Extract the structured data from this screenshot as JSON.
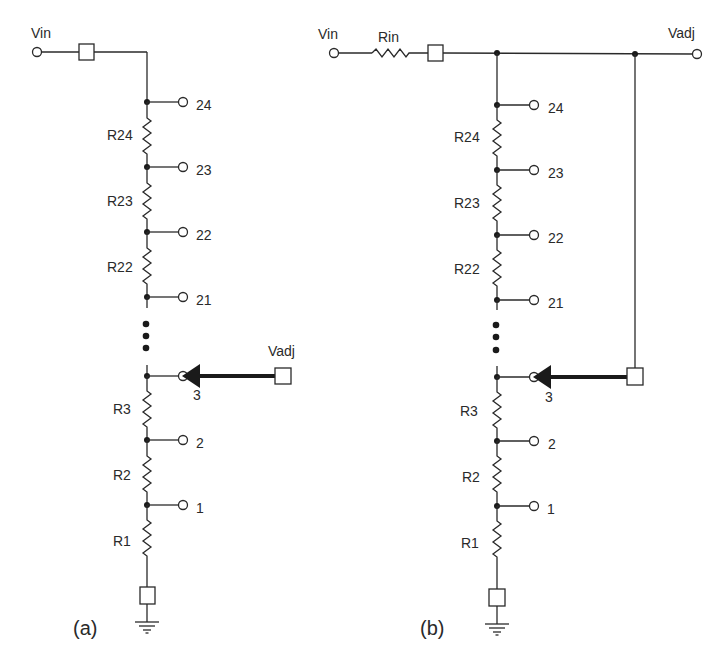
{
  "figure": {
    "panels": [
      {
        "id": "a",
        "caption": "(a)",
        "input_label": "Vin",
        "output_label": "Vadj",
        "resistors": [
          "R24",
          "R23",
          "R22",
          "R3",
          "R2",
          "R1"
        ],
        "taps": [
          "24",
          "23",
          "22",
          "21",
          "3",
          "2",
          "1"
        ],
        "selected_tap": "3"
      },
      {
        "id": "b",
        "caption": "(b)",
        "input_label": "Vin",
        "series_resistor": "Rin",
        "output_label": "Vadj",
        "resistors": [
          "R24",
          "R23",
          "R22",
          "R3",
          "R2",
          "R1"
        ],
        "taps": [
          "24",
          "23",
          "22",
          "21",
          "3",
          "2",
          "1"
        ],
        "selected_tap": "3"
      }
    ],
    "colors": {
      "line": "#2a2a2a",
      "node": "#1a1a1a",
      "background": "#ffffff"
    }
  }
}
